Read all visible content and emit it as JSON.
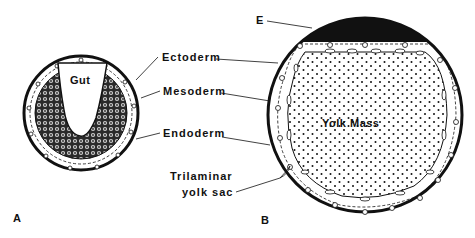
{
  "figure": {
    "panels": [
      {
        "id": "A",
        "label": "A",
        "structure_label": "Gut"
      },
      {
        "id": "B",
        "label": "B",
        "structure_label": "Yolk Mass",
        "cap_label": "E"
      }
    ],
    "labels": {
      "ectoderm": "Ectoderm",
      "mesoderm": "Mesoderm",
      "endoderm": "Endoderm",
      "trilaminar_line1": "Trilaminar",
      "trilaminar_line2": "yolk sac",
      "e": "E"
    },
    "colors": {
      "ink": "#111111",
      "background": "#ffffff"
    }
  }
}
